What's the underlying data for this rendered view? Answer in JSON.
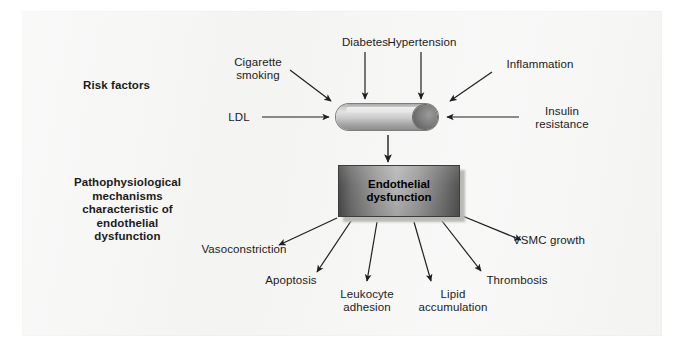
{
  "figure": {
    "type": "flow-diagram"
  },
  "sections": {
    "risk_factors_label": "Risk factors",
    "mechanisms_label_lines": [
      "Pathophysiological",
      "mechanisms",
      "characteristic of",
      "endothelial",
      "dysfunction"
    ]
  },
  "risk_factors": [
    {
      "id": "cigarette-smoking",
      "lines": [
        "Cigarette",
        "smoking"
      ]
    },
    {
      "id": "diabetes",
      "lines": [
        "Diabetes"
      ]
    },
    {
      "id": "hypertension",
      "lines": [
        "Hypertension"
      ]
    },
    {
      "id": "inflammation",
      "lines": [
        "Inflammation"
      ]
    },
    {
      "id": "insulin-resistance",
      "lines": [
        "Insulin",
        "resistance"
      ]
    },
    {
      "id": "ldl",
      "lines": [
        "LDL"
      ]
    }
  ],
  "central": {
    "vessel_name": "blood-vessel",
    "box_line1": "Endothelial",
    "box_line2": "dysfunction"
  },
  "outcomes": [
    {
      "id": "vasoconstriction",
      "lines": [
        "Vasoconstriction"
      ]
    },
    {
      "id": "apoptosis",
      "lines": [
        "Apoptosis"
      ]
    },
    {
      "id": "leukocyte-adhesion",
      "lines": [
        "Leukocyte",
        "adhesion"
      ]
    },
    {
      "id": "lipid-accumulation",
      "lines": [
        "Lipid",
        "accumulation"
      ]
    },
    {
      "id": "thrombosis",
      "lines": [
        "Thrombosis"
      ]
    },
    {
      "id": "vsmc-growth",
      "lines": [
        "VSMC growth"
      ]
    }
  ],
  "colors": {
    "background": "#ffffff",
    "panel": "#f3f3f2",
    "text": "#1b1b1b",
    "arrow": "#1f1f1f",
    "box_dark": "#4d4d4d",
    "box_light": "#b6b6b6"
  },
  "text": {
    "cigarette_1": "Cigarette",
    "cigarette_2": "smoking",
    "diabetes": "Diabetes",
    "hypertension": "Hypertension",
    "inflammation": "Inflammation",
    "insulin_1": "Insulin",
    "insulin_2": "resistance",
    "ldl": "LDL",
    "risk_factors": "Risk factors",
    "mech_1": "Pathophysiological",
    "mech_2": "mechanisms",
    "mech_3": "characteristic of",
    "mech_4": "endothelial",
    "mech_5": "dysfunction",
    "ed_1": "Endothelial",
    "ed_2": "dysfunction",
    "vasoconstriction": "Vasoconstriction",
    "apoptosis": "Apoptosis",
    "leukocyte_1": "Leukocyte",
    "leukocyte_2": "adhesion",
    "lipid_1": "Lipid",
    "lipid_2": "accumulation",
    "thrombosis": "Thrombosis",
    "vsmc": "VSMC growth"
  }
}
